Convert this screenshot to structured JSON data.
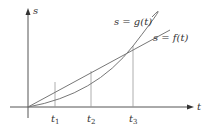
{
  "diagram": {
    "axes": {
      "vertical_label": "s",
      "horizontal_label": "t"
    },
    "curves": [
      {
        "name": "g",
        "label": "s = g(t)",
        "shape": "convex curve"
      },
      {
        "name": "f",
        "label": "s = f(t)",
        "shape": "straight line"
      }
    ],
    "ticks": [
      {
        "label": "t",
        "sub": "1"
      },
      {
        "label": "t",
        "sub": "2"
      },
      {
        "label": "t",
        "sub": "3"
      }
    ],
    "colors": {
      "axis": "#555555",
      "curve": "#777777",
      "text": "#333333"
    }
  }
}
